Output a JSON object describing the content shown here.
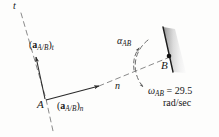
{
  "figure": {
    "kind": "kinematics-vector-diagram",
    "background_color": "#fdfdfc",
    "ink_color": "#161616",
    "labels": {
      "tangent_axis": "t",
      "normal_axis": "n",
      "point_a": "A",
      "point_b": "B",
      "accel_tangential_prefix": "(",
      "accel_tangential_bold": "a",
      "accel_tangential_sub_inner": "A/B",
      "accel_tangential_close": ")",
      "accel_tangential_sub_outer": "t",
      "accel_normal_prefix": "(",
      "accel_normal_bold": "a",
      "accel_normal_sub_inner": "A/B",
      "accel_normal_close": ")",
      "accel_normal_sub_outer": "n",
      "alpha_symbol": "α",
      "alpha_subscript": "AB",
      "omega_symbol": "ω",
      "omega_subscript": "AB",
      "omega_equals_value": " = 29.5",
      "omega_units": "rad/sec"
    },
    "values": {
      "omega_AB": 29.5,
      "omega_units": "rad/sec"
    },
    "colors": {
      "wall_edge": "#1b1b1b",
      "wall_fill_dark": "#9a9a9a",
      "wall_fill_light": "#f4f4f4",
      "dashed_line": "#767676",
      "solid_vector": "#2a2a2a"
    }
  }
}
